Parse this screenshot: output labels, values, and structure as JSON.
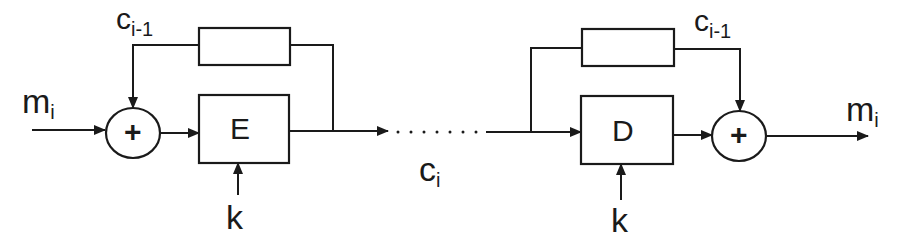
{
  "diagram": {
    "encrypt_side": {
      "input_label": {
        "base": "m",
        "sub": "i"
      },
      "feedback_label": {
        "base": "c",
        "sub": "i-1"
      },
      "xor_symbol": "+",
      "block_label": "E",
      "key_label": "k",
      "delay_block_label": ""
    },
    "channel": {
      "label": {
        "base": "c",
        "sub": "i"
      },
      "dots": ". . . . . . ."
    },
    "decrypt_side": {
      "output_label": {
        "base": "m",
        "sub": "i"
      },
      "feedback_label": {
        "base": "c",
        "sub": "i-1"
      },
      "xor_symbol": "+",
      "block_label": "D",
      "key_label": "k",
      "delay_block_label": ""
    },
    "colors": {
      "stroke": "#1a1a1a",
      "background": "#ffffff"
    }
  }
}
